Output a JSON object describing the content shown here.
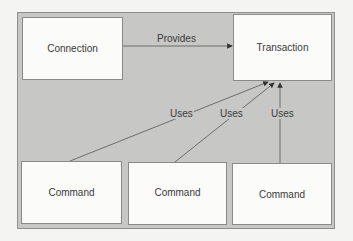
{
  "diagram": {
    "nodes": [
      {
        "id": "connection",
        "label": "Connection"
      },
      {
        "id": "transaction",
        "label": "Transaction"
      },
      {
        "id": "command1",
        "label": "Command"
      },
      {
        "id": "command2",
        "label": "Command"
      },
      {
        "id": "command3",
        "label": "Command"
      }
    ],
    "edges": [
      {
        "from": "connection",
        "to": "transaction",
        "label": "Provides"
      },
      {
        "from": "command1",
        "to": "transaction",
        "label": "Uses"
      },
      {
        "from": "command2",
        "to": "transaction",
        "label": "Uses"
      },
      {
        "from": "command3",
        "to": "transaction",
        "label": "Uses"
      }
    ]
  },
  "colors": {
    "panel": "#c7c7c5",
    "box": "#fbfbfa",
    "line": "#555555"
  }
}
